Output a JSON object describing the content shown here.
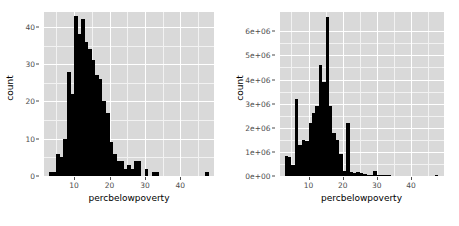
{
  "figure": {
    "background": "#ffffff",
    "panel_background": "#d9d9d9",
    "grid_major_color": "#ffffff",
    "grid_minor_color": "#f2f2f2",
    "bar_color": "#000000",
    "axis_text_color": "#4d4d4d",
    "layout": "two panels side by side"
  },
  "chart_data": [
    {
      "type": "bar",
      "subtype": "histogram",
      "title": "",
      "xlabel": "percbelowpoverty",
      "ylabel": "count",
      "xlim": [
        1.5,
        49.5
      ],
      "ylim": [
        0,
        44
      ],
      "xticks": [
        10,
        20,
        30,
        40
      ],
      "yticks": [
        0,
        10,
        20,
        30,
        40
      ],
      "xtick_labels": [
        "10",
        "20",
        "30",
        "40"
      ],
      "ytick_labels": [
        "0",
        "10",
        "20",
        "30",
        "40"
      ],
      "grid": true,
      "legend": "none",
      "bin_width": 1,
      "bins": [
        {
          "x": 2.5,
          "value": 0
        },
        {
          "x": 3.5,
          "value": 1
        },
        {
          "x": 4.5,
          "value": 1
        },
        {
          "x": 5.5,
          "value": 6
        },
        {
          "x": 6.5,
          "value": 5
        },
        {
          "x": 7.5,
          "value": 10
        },
        {
          "x": 8.5,
          "value": 28
        },
        {
          "x": 9.5,
          "value": 22
        },
        {
          "x": 10.5,
          "value": 43
        },
        {
          "x": 11.5,
          "value": 38
        },
        {
          "x": 12.5,
          "value": 42
        },
        {
          "x": 13.5,
          "value": 36
        },
        {
          "x": 14.5,
          "value": 34
        },
        {
          "x": 15.5,
          "value": 31
        },
        {
          "x": 16.5,
          "value": 27
        },
        {
          "x": 17.5,
          "value": 26
        },
        {
          "x": 18.5,
          "value": 20
        },
        {
          "x": 19.5,
          "value": 17
        },
        {
          "x": 20.5,
          "value": 9
        },
        {
          "x": 21.5,
          "value": 6
        },
        {
          "x": 22.5,
          "value": 4
        },
        {
          "x": 23.5,
          "value": 4
        },
        {
          "x": 24.5,
          "value": 2
        },
        {
          "x": 25.5,
          "value": 3
        },
        {
          "x": 26.5,
          "value": 2
        },
        {
          "x": 27.5,
          "value": 4
        },
        {
          "x": 28.5,
          "value": 4
        },
        {
          "x": 29.5,
          "value": 0
        },
        {
          "x": 30.5,
          "value": 2
        },
        {
          "x": 31.5,
          "value": 0
        },
        {
          "x": 32.5,
          "value": 1
        },
        {
          "x": 33.5,
          "value": 1
        },
        {
          "x": 34.5,
          "value": 0
        },
        {
          "x": 47.5,
          "value": 1
        }
      ]
    },
    {
      "type": "bar",
      "subtype": "histogram",
      "title": "",
      "xlabel": "percbelowpoverty",
      "ylabel": "count",
      "xlim": [
        1.5,
        49.5
      ],
      "ylim": [
        0,
        6800000
      ],
      "xticks": [
        10,
        20,
        30,
        40
      ],
      "yticks": [
        0,
        1000000,
        2000000,
        3000000,
        4000000,
        5000000,
        6000000
      ],
      "xtick_labels": [
        "10",
        "20",
        "30",
        "40"
      ],
      "ytick_labels": [
        "0e+00",
        "1e+06",
        "2e+06",
        "3e+06",
        "4e+06",
        "5e+06",
        "6e+06"
      ],
      "grid": true,
      "legend": "none",
      "bin_width": 1,
      "bins": [
        {
          "x": 2.5,
          "value": 0
        },
        {
          "x": 3.5,
          "value": 850000
        },
        {
          "x": 4.5,
          "value": 800000
        },
        {
          "x": 5.5,
          "value": 450000
        },
        {
          "x": 6.5,
          "value": 3200000
        },
        {
          "x": 7.5,
          "value": 1300000
        },
        {
          "x": 8.5,
          "value": 1500000
        },
        {
          "x": 9.5,
          "value": 1450000
        },
        {
          "x": 10.5,
          "value": 2200000
        },
        {
          "x": 11.5,
          "value": 2600000
        },
        {
          "x": 12.5,
          "value": 2900000
        },
        {
          "x": 13.5,
          "value": 4600000
        },
        {
          "x": 14.5,
          "value": 3900000
        },
        {
          "x": 15.5,
          "value": 6600000
        },
        {
          "x": 16.5,
          "value": 2900000
        },
        {
          "x": 17.5,
          "value": 1800000
        },
        {
          "x": 18.5,
          "value": 1500000
        },
        {
          "x": 19.5,
          "value": 900000
        },
        {
          "x": 20.5,
          "value": 200000
        },
        {
          "x": 21.5,
          "value": 2200000
        },
        {
          "x": 22.5,
          "value": 150000
        },
        {
          "x": 23.5,
          "value": 120000
        },
        {
          "x": 24.5,
          "value": 150000
        },
        {
          "x": 25.5,
          "value": 130000
        },
        {
          "x": 26.5,
          "value": 100000
        },
        {
          "x": 27.5,
          "value": 60000
        },
        {
          "x": 28.5,
          "value": 50000
        },
        {
          "x": 29.5,
          "value": 200000
        },
        {
          "x": 30.5,
          "value": 20000
        },
        {
          "x": 31.5,
          "value": 15000
        },
        {
          "x": 32.5,
          "value": 10000
        },
        {
          "x": 33.5,
          "value": 8000
        },
        {
          "x": 47.5,
          "value": 5000
        }
      ]
    }
  ]
}
